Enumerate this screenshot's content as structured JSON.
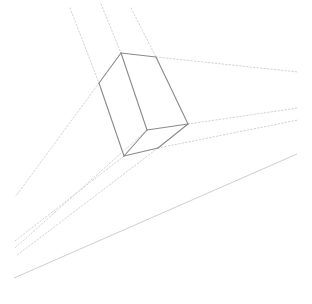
{
  "diagram": {
    "type": "perspective-box-sketch",
    "colors": {
      "background": "#ffffff",
      "box_stroke": "#8a8a8a",
      "guide_stroke": "#d4d4d4",
      "horizon_stroke": "#cfcfcf"
    },
    "box": {
      "vertices": {
        "top": [
          121,
          53
        ],
        "top_right": [
          156,
          57
        ],
        "left": [
          99,
          83
        ],
        "middle": [
          147,
          130
        ],
        "right": [
          188,
          124
        ],
        "bottom": [
          124,
          156
        ],
        "bottom_right": [
          158,
          148
        ]
      },
      "edges": [
        [
          "top",
          "top_right"
        ],
        [
          "top",
          "left"
        ],
        [
          "top",
          "middle"
        ],
        [
          "top_right",
          "right"
        ],
        [
          "left",
          "bottom"
        ],
        [
          "middle",
          "right"
        ],
        [
          "middle",
          "bottom"
        ],
        [
          "bottom",
          "bottom_right"
        ],
        [
          "bottom_right",
          "right"
        ]
      ]
    },
    "guides_vertical": [
      [
        [
          70,
          8
        ],
        [
          99,
          83
        ]
      ],
      [
        [
          101,
          4
        ],
        [
          121,
          53
        ]
      ],
      [
        [
          131,
          8
        ],
        [
          156,
          57
        ]
      ]
    ],
    "guides_right": [
      [
        [
          156,
          57
        ],
        [
          298,
          72
        ]
      ],
      [
        [
          188,
          124
        ],
        [
          298,
          108
        ]
      ],
      [
        [
          158,
          148
        ],
        [
          298,
          120
        ]
      ]
    ],
    "guides_left": [
      [
        [
          99,
          83
        ],
        [
          16,
          196
        ]
      ],
      [
        [
          124,
          156
        ],
        [
          15,
          241
        ]
      ],
      [
        [
          147,
          130
        ],
        [
          15,
          248
        ]
      ],
      [
        [
          158,
          148
        ],
        [
          16,
          256
        ]
      ]
    ],
    "horizon_line": [
      [
        14,
        278
      ],
      [
        297,
        154
      ]
    ]
  }
}
